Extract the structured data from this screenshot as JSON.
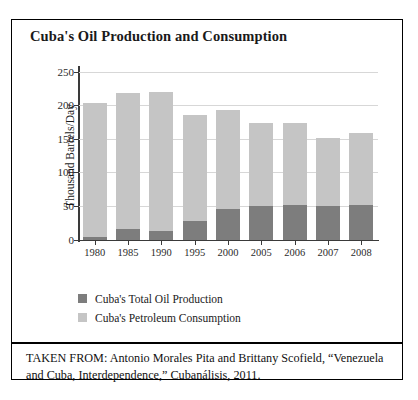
{
  "figure": {
    "title": "Cuba's Oil Production and Consumption",
    "source_text": "TAKEN FROM: Antonio Morales Pita and Brittany Scofield, “Venezuela and Cuba, Interdependence,” Cubanálisis, 2011.",
    "source_prefix": "TAKEN FROM:"
  },
  "legend": {
    "position": "below-plot",
    "items": [
      {
        "label": "Cuba's Total Oil Production",
        "color": "#7d7d7d",
        "key": "production"
      },
      {
        "label": "Cuba's Petroleum Consumption",
        "color": "#c5c5c5",
        "key": "consumption"
      }
    ]
  },
  "chart_data": {
    "type": "bar",
    "subtype": "stacked-overlay",
    "title": "Cuba's Oil Production and Consumption",
    "xlabel": "",
    "ylabel": "Thousand Barrels/Day",
    "categories": [
      "1980",
      "1985",
      "1990",
      "1995",
      "2000",
      "2005",
      "2006",
      "2007",
      "2008"
    ],
    "ylim": [
      0,
      250
    ],
    "yticks": [
      0,
      50,
      100,
      150,
      200,
      250
    ],
    "ytick_labels": [
      "0",
      "50",
      "100",
      "150",
      "200",
      "250"
    ],
    "grid": true,
    "grid_axis": "y",
    "series": [
      {
        "name": "Cuba's Petroleum Consumption",
        "key": "consumption",
        "color": "#c5c5c5",
        "values": [
          203,
          218,
          220,
          186,
          193,
          174,
          174,
          151,
          159
        ]
      },
      {
        "name": "Cuba's Total Oil Production",
        "key": "production",
        "color": "#7d7d7d",
        "values": [
          3,
          15,
          12,
          27,
          45,
          50,
          51,
          50,
          52
        ]
      }
    ],
    "units": "thousand barrels per day"
  },
  "colors": {
    "production": "#7d7d7d",
    "consumption": "#c5c5c5",
    "axis": "#3a3a3a",
    "grid": "#d7d7d7",
    "frame": "#000000",
    "text": "#1a1a1a",
    "background": "#ffffff"
  }
}
